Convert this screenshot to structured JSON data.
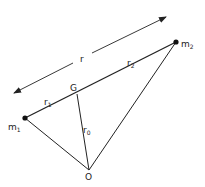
{
  "diagram": {
    "labels": {
      "r": "r",
      "r1": "r",
      "r1_sub": "1",
      "r2": "r",
      "r2_sub": "2",
      "r0": "r",
      "r0_sub": "0",
      "G": "G",
      "O": "O",
      "m1": "m",
      "m1_sub": "1",
      "m2": "m",
      "m2_sub": "2"
    },
    "points": {
      "m1": [
        25,
        118
      ],
      "m2": [
        176,
        42
      ],
      "G": [
        77,
        94
      ],
      "O": [
        89,
        170
      ]
    },
    "line_color": "#222222"
  }
}
